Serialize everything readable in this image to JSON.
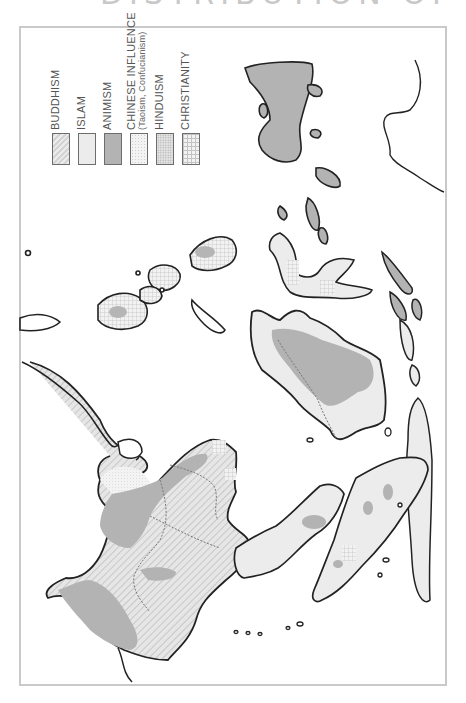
{
  "title": "DISTRIBUTION OF MAIN RELIGIONS",
  "legend": {
    "items": [
      {
        "label": "BUDDHISM",
        "sub": "",
        "pattern": "diagonal-hatch",
        "color": "#d8d8d8"
      },
      {
        "label": "ISLAM",
        "sub": "",
        "pattern": "solid-light",
        "color": "#ececec"
      },
      {
        "label": "ANIMISM",
        "sub": "",
        "pattern": "solid-medium",
        "color": "#b3b3b3"
      },
      {
        "label": "CHINESE INFLUENCE",
        "sub": "(Taoism, Confucianism)",
        "pattern": "fine-dots",
        "color": "#f0f0f0"
      },
      {
        "label": "HINDUISM",
        "sub": "",
        "pattern": "stipple",
        "color": "#dedede"
      },
      {
        "label": "CHRISTIANITY",
        "sub": "",
        "pattern": "crosshatch-grid",
        "color": "#e4e4e4"
      }
    ]
  },
  "map": {
    "orientation": "rotated 90° (north to the left)",
    "regions": [
      {
        "name": "Indochina mainland",
        "religions": [
          "Buddhism",
          "Animism",
          "Chinese Influence",
          "Christianity"
        ]
      },
      {
        "name": "Malay Peninsula",
        "religions": [
          "Islam",
          "Animism",
          "Buddhism"
        ]
      },
      {
        "name": "Sumatra",
        "religions": [
          "Islam",
          "Animism",
          "Christianity"
        ]
      },
      {
        "name": "Borneo",
        "religions": [
          "Islam",
          "Animism"
        ]
      },
      {
        "name": "Java / Bali",
        "religions": [
          "Islam",
          "Hinduism"
        ]
      },
      {
        "name": "Sulawesi",
        "religions": [
          "Islam",
          "Christianity"
        ]
      },
      {
        "name": "Philippines",
        "religions": [
          "Christianity",
          "Islam"
        ]
      },
      {
        "name": "New Guinea",
        "religions": [
          "Animism"
        ]
      },
      {
        "name": "Lesser Sunda / Moluccas",
        "religions": [
          "Animism",
          "Islam",
          "Christianity"
        ]
      }
    ]
  }
}
